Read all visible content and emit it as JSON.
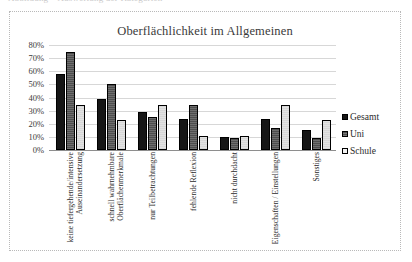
{
  "page": {
    "top_cropped_text": "Abbildung – Auswertung der Kategorien"
  },
  "legend": {
    "position": "right",
    "items": [
      {
        "label": "Gesamt",
        "color": "#161616",
        "icon": "legend-swatch-filled"
      },
      {
        "label": "Uni",
        "color": "#4e4e4e",
        "icon": "legend-swatch-hatched"
      },
      {
        "label": "Schule",
        "color": "#f2f2f2",
        "icon": "legend-swatch-open"
      }
    ]
  },
  "axis": {
    "y_ticks": [
      "80%",
      "70%",
      "60%",
      "50%",
      "40%",
      "30%",
      "20%",
      "10%",
      "0%"
    ]
  },
  "chart_data": {
    "type": "bar",
    "title": "Oberflächlichkeit im Allgemeinen",
    "xlabel": "",
    "ylabel": "",
    "ylim": [
      0,
      80
    ],
    "ytick_step": 10,
    "grid": true,
    "legend_position": "right",
    "categories": [
      "keine tiefergehende/intensive Auseinandersetzung",
      "schnell wahrnehmbare Oberflächenmerkmale",
      "nur Teilbetrachtungen",
      "fehlende Reflexion",
      "nicht durchdacht",
      "Eigenschaften / Einstellungen",
      "Sonstiges"
    ],
    "series": [
      {
        "name": "Gesamt",
        "values": [
          58,
          39,
          29,
          24,
          10,
          24,
          15
        ]
      },
      {
        "name": "Uni",
        "values": [
          75,
          50,
          25,
          34,
          9,
          17,
          9
        ]
      },
      {
        "name": "Schule",
        "values": [
          34,
          23,
          34,
          11,
          11,
          34,
          23
        ]
      }
    ]
  }
}
